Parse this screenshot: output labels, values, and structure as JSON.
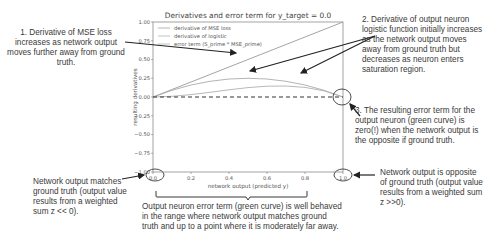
{
  "chart_data": {
    "type": "line",
    "title": "Derivatives and error term for y_target = 0.0",
    "xlabel": "network output (predicted y)",
    "ylabel": "resulting derivatives",
    "xlim": [
      0.0,
      1.0
    ],
    "ylim": [
      -1.0,
      1.0
    ],
    "xticks": [
      "0.0",
      "0.2",
      "0.4",
      "0.6",
      "0.8",
      "1.0"
    ],
    "yticks": [
      "1.00",
      "0.75",
      "0.50",
      "0.25",
      "0.00",
      "-0.25",
      "-0.50",
      "-0.75",
      "-1.00"
    ],
    "grid": false,
    "legend_position": "upper left",
    "x": [
      0.0,
      0.1,
      0.2,
      0.3,
      0.4,
      0.5,
      0.6,
      0.7,
      0.8,
      0.9,
      1.0
    ],
    "series": [
      {
        "name": "derivative of MSE loss",
        "values": [
          0.0,
          0.1,
          0.2,
          0.3,
          0.4,
          0.5,
          0.6,
          0.7,
          0.8,
          0.9,
          1.0
        ]
      },
      {
        "name": "derivative of logistic",
        "values": [
          0.0,
          0.09,
          0.16,
          0.21,
          0.24,
          0.25,
          0.24,
          0.21,
          0.16,
          0.09,
          0.0
        ]
      },
      {
        "name": "error term (S_prime * MSE_prime)",
        "values": [
          0.0,
          0.009,
          0.032,
          0.063,
          0.096,
          0.125,
          0.144,
          0.147,
          0.128,
          0.081,
          0.0
        ]
      }
    ],
    "reference_line": {
      "y": 0.0,
      "style": "dashed"
    }
  },
  "annotations": {
    "a1": "1. Derivative of MSE loss increases as network output moves further away from ground truth.",
    "a2": "2. Derivative of output neuron logistic function initially increases as the network output moves away from ground truth but decreases as neuron enters saturation region.",
    "a3": "3. The resulting error term for the output neuron (green curve) is zero(!) when the network output is the opposite if ground truth.",
    "left_bottom": "Network output matches ground truth (output value results from a weighted sum z << 0).",
    "right_bottom": "Network output is opposite of ground truth (output value results from a weighted sum z >>0).",
    "bottom_center": "Output neuron error term (green curve) is well behaved in the range where network output matches ground truth and up to a point where it is moderately far away."
  }
}
